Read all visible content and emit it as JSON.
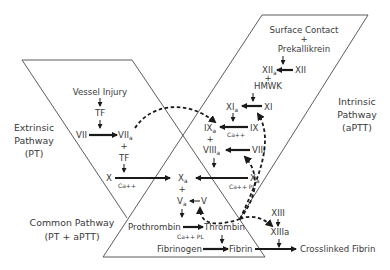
{
  "diagram": {
    "type": "coagulation-cascade",
    "regions": {
      "extrinsic": {
        "line1": "Extrinsic",
        "line2": "Pathway",
        "line3": "(PT)"
      },
      "intrinsic": {
        "line1": "Intrinsic",
        "line2": "Pathway",
        "line3": "(aPTT)"
      },
      "common": {
        "line1": "Common Pathway",
        "line2": "(PT + aPTT)"
      }
    },
    "nodes": {
      "surface_contact": "Surface Contact",
      "plus1": "+",
      "prekallikrein": "Prekallikrein",
      "xii": "XII",
      "xiia": "XII",
      "xiia_sub": "a",
      "plus2": "+",
      "hmwk": "HMWK",
      "xi": "XI",
      "xia": "XI",
      "xia_sub": "a",
      "ix": "IX",
      "ixa": "IX",
      "ixa_sub": "a",
      "ca_ix": "Ca++",
      "plus3": "+",
      "viii": "VIII",
      "viiia": "VIII",
      "viiia_sub": "a",
      "vessel_injury": "Vessel Injury",
      "tf1": "TF",
      "vii": "VII",
      "viia": "VII",
      "viia_sub": "a",
      "plus4": "+",
      "tf2": "TF",
      "x_left": "X",
      "ca_x_left": "Ca++",
      "x_right": "X",
      "x_right_sub": "a",
      "ca_pl_x": "Ca++ PL",
      "xa": "X",
      "xa_sub": "a",
      "plus5": "+",
      "va": "V",
      "va_sub": "a",
      "v": "V",
      "prothrombin": "Prothrombin",
      "thrombin": "Thrombin",
      "ca_pl_pt": "Ca++ PL",
      "fibrinogen": "Fibrinogen",
      "fibrin": "Fibrin",
      "xiii": "XIII",
      "xiiia": "XIIIa",
      "crosslinked_fibrin": "Crosslinked Fibrin"
    },
    "edges": [
      {
        "from": "Vessel Injury",
        "to": "TF",
        "style": "solid"
      },
      {
        "from": "TF",
        "to": "VII",
        "style": "solid"
      },
      {
        "from": "VII",
        "to": "VIIa",
        "style": "solid"
      },
      {
        "from": "TF",
        "to": "X",
        "style": "solid"
      },
      {
        "from": "X",
        "to": "Xa",
        "style": "solid",
        "cofactor": "Ca++"
      },
      {
        "from": "Surface Contact + Prekallikrein",
        "to": "XIIa",
        "style": "solid"
      },
      {
        "from": "XII",
        "to": "XIIa",
        "style": "solid"
      },
      {
        "from": "HMWK",
        "to": "XIa",
        "style": "solid"
      },
      {
        "from": "XI",
        "to": "XIa",
        "style": "solid"
      },
      {
        "from": "XIa",
        "to": "IXa",
        "style": "solid"
      },
      {
        "from": "IX",
        "to": "IXa",
        "style": "solid",
        "cofactor": "Ca++"
      },
      {
        "from": "VIII",
        "to": "VIIIa",
        "style": "solid"
      },
      {
        "from": "VIIIa",
        "to": "Xa (intrinsic)",
        "style": "solid"
      },
      {
        "from": "X",
        "to": "Xa",
        "style": "solid",
        "cofactor": "Ca++ PL"
      },
      {
        "from": "V",
        "to": "Va",
        "style": "solid"
      },
      {
        "from": "Va",
        "to": "Prothrombin",
        "style": "solid"
      },
      {
        "from": "Prothrombin",
        "to": "Thrombin",
        "style": "solid",
        "cofactor": "Ca++ PL"
      },
      {
        "from": "Thrombin",
        "to": "Fibrin",
        "style": "solid"
      },
      {
        "from": "Fibrinogen",
        "to": "Fibrin",
        "style": "solid"
      },
      {
        "from": "Fibrin",
        "to": "Crosslinked Fibrin",
        "style": "solid"
      },
      {
        "from": "XIII",
        "to": "XIIIa",
        "style": "solid"
      },
      {
        "from": "XIIIa",
        "to": "Crosslinked Fibrin",
        "style": "solid"
      },
      {
        "from": "VIIa",
        "to": "IXa",
        "style": "dashed",
        "label": "feedback"
      },
      {
        "from": "Thrombin",
        "to": "XIa",
        "style": "dashed",
        "label": "feedback"
      },
      {
        "from": "Thrombin",
        "to": "VIIIa",
        "style": "dashed",
        "label": "feedback"
      },
      {
        "from": "Thrombin",
        "to": "Va",
        "style": "dashed",
        "label": "feedback"
      },
      {
        "from": "Thrombin",
        "to": "XIIIa",
        "style": "dashed",
        "label": "feedback"
      }
    ]
  }
}
